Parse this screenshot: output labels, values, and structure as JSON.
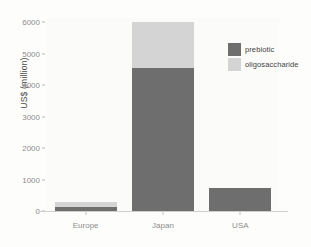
{
  "chart_data": {
    "type": "bar",
    "subtype": "stacked-bar",
    "title": "",
    "xlabel": "",
    "ylabel": "US$ (million)",
    "categories": [
      "Europe",
      "Japan",
      "USA"
    ],
    "series": [
      {
        "name": "prebiotic",
        "color": "#6e6e6e",
        "values": [
          130,
          4540,
          730
        ]
      },
      {
        "name": "oligosaccharide",
        "color": "#d4d4d4",
        "values": [
          160,
          1460,
          0
        ]
      }
    ],
    "totals": [
      290,
      6000,
      730
    ],
    "ylim": [
      0,
      6200
    ],
    "yticks": [
      0,
      1000,
      2000,
      3000,
      4000,
      5000,
      6000
    ],
    "ytick_labels": [
      "0",
      "1000",
      "2000",
      "3000",
      "4000",
      "5000",
      "6000"
    ],
    "grid": false,
    "legend_position": "top-right-inside",
    "background": "#fdfdfb",
    "panel_background": "#fbfbf9",
    "axis_color": "#cfcfcf",
    "tick_label_color": "#8d8d8d"
  },
  "legend": {
    "entries": [
      {
        "label": "prebiotic",
        "color": "#6e6e6e"
      },
      {
        "label": "oligosaccharide",
        "color": "#d4d4d4"
      }
    ]
  },
  "axes": {
    "y_title": "US$ (million)"
  }
}
